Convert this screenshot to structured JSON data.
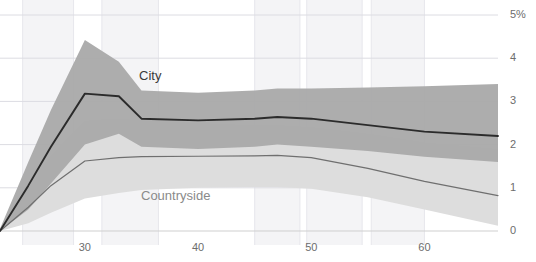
{
  "chart_data": {
    "type": "area",
    "title": "",
    "clipped_header_text": "",
    "xlabel": "",
    "ylabel": "",
    "xlim": [
      22.5,
      66.5
    ],
    "ylim": [
      0,
      5
    ],
    "grid": true,
    "legend_position": "inline-annotation",
    "y_ticks": [
      "5%",
      "4",
      "3",
      "2",
      "1",
      "0"
    ],
    "y_tick_values": [
      5,
      4,
      3,
      2,
      1,
      0
    ],
    "x_ticks": [
      "30",
      "40",
      "50",
      "60"
    ],
    "x_tick_values": [
      30,
      40,
      50,
      60
    ],
    "series": [
      {
        "name": "City",
        "color": "#2b2b2b",
        "band_color": "#a9a9a9",
        "x": [
          22.5,
          25,
          27,
          30,
          33,
          35,
          40,
          45,
          47,
          50,
          55,
          60,
          66.5
        ],
        "values": [
          0.0,
          1.05,
          1.95,
          3.18,
          3.12,
          2.6,
          2.56,
          2.6,
          2.64,
          2.6,
          2.45,
          2.3,
          2.2
        ],
        "band_upper": [
          0.05,
          1.6,
          2.8,
          4.42,
          3.92,
          3.25,
          3.2,
          3.25,
          3.3,
          3.3,
          3.32,
          3.35,
          3.4
        ],
        "band_lower": [
          0.0,
          0.5,
          1.1,
          2.0,
          2.25,
          1.95,
          1.9,
          1.95,
          2.0,
          1.95,
          1.85,
          1.72,
          1.6
        ]
      },
      {
        "name": "Countryside",
        "color": "#6f6f6f",
        "band_color": "#dddddd",
        "x": [
          22.5,
          25,
          27,
          30,
          33,
          35,
          40,
          45,
          47,
          50,
          55,
          60,
          66.5
        ],
        "values": [
          0.0,
          0.55,
          1.05,
          1.62,
          1.7,
          1.72,
          1.73,
          1.74,
          1.75,
          1.7,
          1.45,
          1.15,
          0.82
        ],
        "band_upper": [
          0.05,
          1.0,
          1.75,
          2.55,
          2.6,
          2.55,
          2.5,
          2.45,
          2.45,
          2.4,
          2.25,
          2.05,
          1.9
        ],
        "band_lower": [
          0.0,
          0.18,
          0.42,
          0.75,
          0.88,
          0.95,
          1.0,
          1.02,
          1.02,
          0.98,
          0.78,
          0.5,
          0.12
        ]
      }
    ],
    "annotations": [
      {
        "text": "City",
        "x_px": 139,
        "y_px": 68
      },
      {
        "text": "Countryside",
        "x_px": 141,
        "y_px": 188
      }
    ],
    "background_stripes": [
      {
        "x0": 24.5,
        "x1": 29.0
      },
      {
        "x0": 31.5,
        "x1": 36.5
      },
      {
        "x0": 45.0,
        "x1": 49.0
      },
      {
        "x0": 49.6,
        "x1": 54.5
      },
      {
        "x0": 55.3,
        "x1": 60.0
      }
    ]
  },
  "axes": {
    "y_axis_name": "percent-axis",
    "x_axis_name": "age-axis"
  }
}
